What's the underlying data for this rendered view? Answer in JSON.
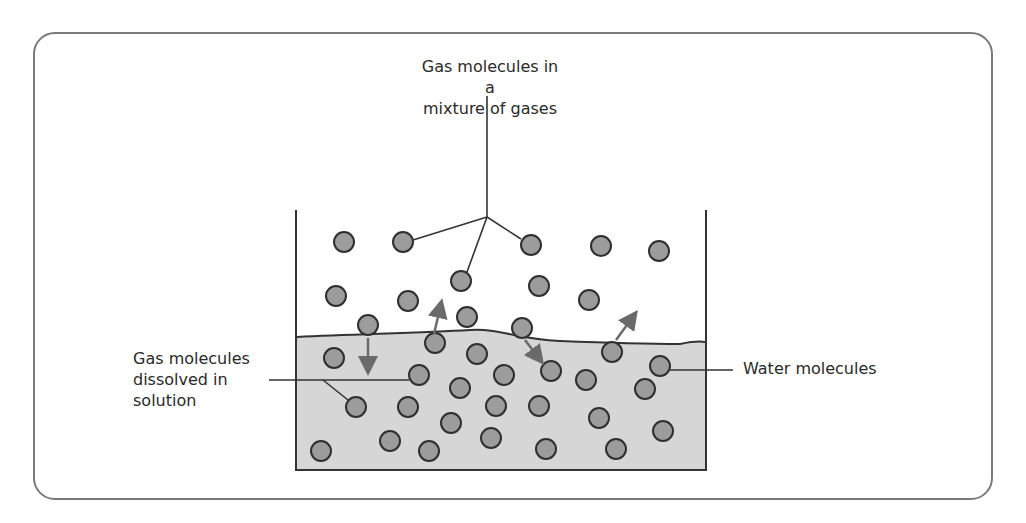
{
  "labels": {
    "gas_mixture": {
      "line1": "Gas molecules in a",
      "line2": "mixture of gases"
    },
    "dissolved": {
      "line1": "Gas molecules",
      "line2": "dissolved in",
      "line3": "solution"
    },
    "water": "Water molecules"
  },
  "colors": {
    "frame": "#7a7a7a",
    "liquid": "#d6d6d6",
    "molecule_fill": "#9c9c9c",
    "molecule_stroke": "#2f2f2f",
    "arrow": "#6a6a6a",
    "line": "#333333"
  },
  "beaker": {
    "left": 296,
    "right": 706,
    "top": 210,
    "bottom": 470,
    "surface_y": 337
  },
  "gas_molecules": [
    [
      344,
      242
    ],
    [
      403,
      242
    ],
    [
      531,
      245
    ],
    [
      601,
      246
    ],
    [
      659,
      251
    ],
    [
      336,
      296
    ],
    [
      408,
      301
    ],
    [
      461,
      281
    ],
    [
      539,
      286
    ],
    [
      589,
      300
    ],
    [
      368,
      325
    ],
    [
      467,
      317
    ],
    [
      522,
      328
    ]
  ],
  "dissolved_molecules": [
    [
      435,
      343
    ],
    [
      334,
      358
    ],
    [
      477,
      354
    ],
    [
      612,
      352
    ],
    [
      660,
      366
    ],
    [
      419,
      375
    ],
    [
      460,
      388
    ],
    [
      504,
      375
    ],
    [
      551,
      371
    ],
    [
      586,
      380
    ],
    [
      645,
      389
    ],
    [
      356,
      407
    ],
    [
      408,
      407
    ],
    [
      496,
      406
    ],
    [
      539,
      406
    ],
    [
      599,
      418
    ],
    [
      451,
      423
    ],
    [
      321,
      451
    ],
    [
      390,
      441
    ],
    [
      491,
      438
    ],
    [
      429,
      451
    ],
    [
      546,
      449
    ],
    [
      616,
      449
    ],
    [
      663,
      431
    ]
  ],
  "exchange_arrows": [
    {
      "from": [
        368,
        338
      ],
      "to": [
        368,
        366
      ],
      "direction": "into-solution"
    },
    {
      "from": [
        434,
        334
      ],
      "to": [
        440,
        308
      ],
      "direction": "out-of-solution"
    },
    {
      "from": [
        525,
        340
      ],
      "to": [
        538,
        357
      ],
      "direction": "into-solution"
    },
    {
      "from": [
        616,
        340
      ],
      "to": [
        632,
        318
      ],
      "direction": "out-of-solution"
    }
  ]
}
